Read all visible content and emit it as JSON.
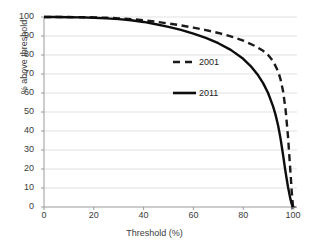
{
  "chart_data": {
    "type": "line",
    "title": "",
    "xlabel": "Threshold (%)",
    "ylabel": "% above threshold",
    "xlim": [
      0,
      100
    ],
    "ylim": [
      0,
      100
    ],
    "xticks": [
      0,
      20,
      40,
      60,
      80,
      100
    ],
    "yticks": [
      0,
      10,
      20,
      30,
      40,
      50,
      60,
      70,
      80,
      90,
      100
    ],
    "grid": "horizontal",
    "legend_position": "center",
    "series": [
      {
        "name": "2001",
        "style": "dashed",
        "color": "#1a1a1a",
        "x": [
          0,
          5,
          10,
          15,
          20,
          25,
          30,
          35,
          40,
          45,
          50,
          55,
          60,
          65,
          70,
          75,
          80,
          85,
          88,
          90,
          92,
          94,
          95,
          96,
          97,
          98,
          99,
          99.5,
          100
        ],
        "y": [
          100,
          100,
          100,
          99.9,
          99.8,
          99.6,
          99.3,
          98.9,
          98.3,
          97.5,
          96.6,
          95.6,
          94.4,
          93.1,
          91.6,
          89.8,
          87.6,
          84.6,
          82.2,
          80.0,
          76.8,
          71.5,
          67.2,
          61.0,
          51.5,
          37.0,
          18.0,
          8.0,
          0
        ]
      },
      {
        "name": "2011",
        "style": "solid",
        "color": "#0d0d0d",
        "x": [
          0,
          5,
          10,
          15,
          20,
          25,
          30,
          35,
          40,
          45,
          50,
          55,
          60,
          65,
          70,
          75,
          80,
          83,
          86,
          88,
          90,
          92,
          93,
          94,
          95,
          96,
          97,
          98,
          99,
          99.5,
          100
        ],
        "y": [
          100,
          100,
          99.9,
          99.8,
          99.6,
          99.3,
          98.9,
          98.3,
          97.4,
          96.2,
          94.8,
          93.2,
          91.3,
          89.0,
          86.2,
          82.7,
          78.0,
          74.2,
          69.3,
          65.2,
          60.0,
          53.0,
          48.5,
          43.0,
          36.0,
          27.5,
          18.5,
          10.5,
          4.0,
          1.5,
          0
        ]
      }
    ]
  },
  "legend": {
    "entries": [
      {
        "label": "2001"
      },
      {
        "label": "2011"
      }
    ]
  },
  "axes": {
    "x_tick_labels": [
      "0",
      "20",
      "40",
      "60",
      "80",
      "100"
    ],
    "y_tick_labels": [
      "0",
      "10",
      "20",
      "30",
      "40",
      "50",
      "60",
      "70",
      "80",
      "90",
      "100"
    ],
    "x_title": "Threshold (%)",
    "y_title": "% above threshold"
  },
  "colors": {
    "series_2001": "#1a1a1a",
    "series_2011": "#0d0d0d",
    "gridline": "#d9d9d9",
    "axis": "#9a9a9a",
    "text": "#3b3b3b"
  }
}
